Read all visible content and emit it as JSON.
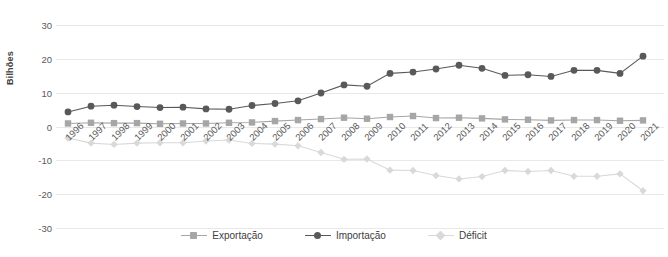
{
  "chart_data": {
    "type": "line",
    "title": "",
    "subtitle": "",
    "xlabel": "",
    "ylabel": "Bilhões",
    "ylim": [
      -30,
      30
    ],
    "yticks": [
      30,
      20,
      10,
      0,
      -10,
      -20,
      -30
    ],
    "grid": true,
    "legend_position": "bottom",
    "categories": [
      "1996",
      "1997",
      "1998",
      "1999",
      "2000",
      "2001",
      "2002",
      "2003",
      "2004",
      "2005",
      "2006",
      "2007",
      "2008",
      "2009",
      "2010",
      "2011",
      "2012",
      "2013",
      "2014",
      "2015",
      "2016",
      "2017",
      "2018",
      "2019",
      "2020",
      "2021"
    ],
    "series": [
      {
        "name": "Exportação",
        "color": "#a6a6a6",
        "marker": "square",
        "values": [
          0.9,
          1.1,
          1.0,
          1.0,
          0.8,
          0.9,
          0.9,
          1.1,
          1.2,
          1.6,
          1.9,
          2.2,
          2.6,
          2.3,
          2.8,
          3.1,
          2.5,
          2.6,
          2.4,
          2.1,
          2.0,
          1.8,
          1.9,
          1.9,
          1.7,
          1.8
        ]
      },
      {
        "name": "Importação",
        "color": "#595959",
        "marker": "circle",
        "values": [
          4.3,
          6.0,
          6.3,
          5.9,
          5.6,
          5.7,
          5.2,
          5.1,
          6.2,
          6.8,
          7.6,
          9.9,
          12.3,
          11.9,
          15.7,
          16.1,
          17.0,
          18.1,
          17.2,
          15.1,
          15.3,
          14.8,
          16.6,
          16.6,
          15.7,
          20.8
        ]
      },
      {
        "name": "Déficit",
        "color": "#d9d9d9",
        "marker": "diamond",
        "values": [
          -3.4,
          -4.9,
          -5.3,
          -4.9,
          -4.8,
          -4.8,
          -4.3,
          -4.0,
          -5.0,
          -5.2,
          -5.7,
          -7.7,
          -9.7,
          -9.6,
          -12.9,
          -13.0,
          -14.5,
          -15.5,
          -14.8,
          -13.0,
          -13.3,
          -13.0,
          -14.7,
          -14.7,
          -14.0,
          -19.0
        ]
      }
    ]
  },
  "legend": {
    "items": [
      {
        "label": "Exportação"
      },
      {
        "label": "Importação"
      },
      {
        "label": "Déficit"
      }
    ]
  },
  "colors": {
    "exportacao": "#a6a6a6",
    "importacao": "#595959",
    "deficit": "#d9d9d9",
    "gridline": "#e8e8e8",
    "tick_text": "#595959",
    "axis_title": "#404040"
  }
}
